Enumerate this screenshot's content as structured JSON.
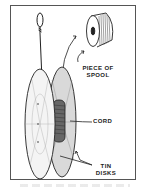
{
  "figure": {
    "labels": {
      "spool_line1": "PIECE OF",
      "spool_line2": "SPOOL",
      "cord": "CORD",
      "tin_line1": "TIN",
      "tin_line2": "DISKS"
    },
    "icons": [
      "loop-knot",
      "cord-string",
      "spool-piece",
      "tin-disk-front",
      "tin-disk-back",
      "wound-cord",
      "arrow"
    ],
    "colors": {
      "ink": "#222222",
      "paper": "#ffffff",
      "frame": "#555555"
    }
  }
}
